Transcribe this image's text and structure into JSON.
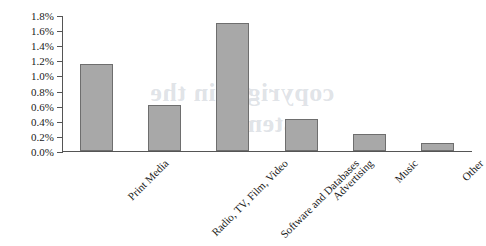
{
  "chart_data": {
    "type": "bar",
    "title": "",
    "xlabel": "",
    "ylabel": "",
    "categories": [
      "Print Media",
      "Radio, TV, Film, Video",
      "Software and Databases",
      "Advertising",
      "Music",
      "Other"
    ],
    "values": [
      1.15,
      0.61,
      1.7,
      0.42,
      0.22,
      0.1
    ],
    "value_labels": [
      "1.15%",
      "0.61%",
      "1.70%",
      "0.42%",
      "0.22%",
      "0.10%"
    ],
    "ylim": [
      0.0,
      1.8
    ],
    "ytick_labels": [
      "0.0%",
      "0.2%",
      "0.4%",
      "0.6%",
      "0.8%",
      "1.0%",
      "1.2%",
      "1.4%",
      "1.6%",
      "1.8%"
    ],
    "ytick_values": [
      0.0,
      0.2,
      0.4,
      0.6,
      0.8,
      1.0,
      1.2,
      1.4,
      1.6,
      1.8
    ],
    "grid": false,
    "legend": false,
    "legend_position": "none",
    "bar_color": "#a8a8a8",
    "bar_border_color": "#6e6e6e",
    "axis_color": "#555555"
  },
  "watermark": {
    "line1": "copyright in the",
    "line2": "system"
  }
}
